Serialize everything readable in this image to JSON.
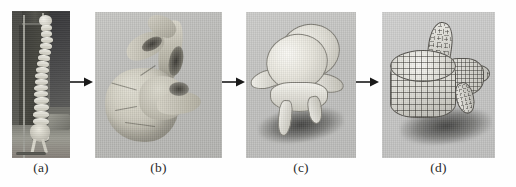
{
  "figure": {
    "panel_count": 4,
    "arrow_count": 3,
    "background_color": "#fefefe"
  },
  "panels": [
    {
      "id": "a",
      "caption": "(a)",
      "content_name": "spine-model-photograph",
      "description": "Photograph of a physical human spine model mounted on a stand",
      "background_color": "#6e6e68",
      "kind": "photograph"
    },
    {
      "id": "b",
      "caption": "(b)",
      "content_name": "raw-scanned-vertebra",
      "description": "Raw 3D scanned vertebra surface, matte clay shading",
      "background_color": "#bdbdba",
      "kind": "render"
    },
    {
      "id": "c",
      "caption": "(c)",
      "content_name": "smooth-shaded-vertebra",
      "description": "Smooth shaded reconstructed vertebra model with cast shadow",
      "background_color": "#c2c2c0",
      "kind": "render"
    },
    {
      "id": "d",
      "caption": "(d)",
      "content_name": "wireframe-mesh-vertebra",
      "description": "Quad wireframe mesh vertebra model with cast shadow",
      "background_color": "#c7c7c6",
      "kind": "render"
    }
  ],
  "arrows": [
    {
      "name": "arrow-a-to-b",
      "from": "a",
      "to": "b",
      "direction": "right",
      "color": "#1a1a1a"
    },
    {
      "name": "arrow-b-to-c",
      "from": "b",
      "to": "c",
      "direction": "right",
      "color": "#1a1a1a"
    },
    {
      "name": "arrow-c-to-d",
      "from": "c",
      "to": "d",
      "direction": "right",
      "color": "#1a1a1a"
    }
  ],
  "caption_style": {
    "color": "#2a2a2a"
  }
}
